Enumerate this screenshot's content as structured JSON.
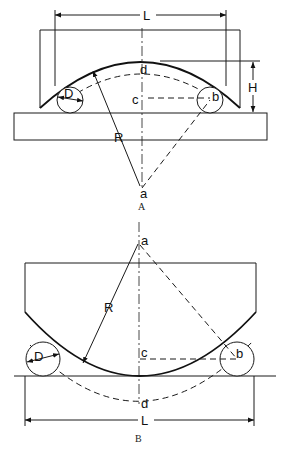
{
  "figure_a": {
    "caption": "A",
    "labels": {
      "L": "L",
      "H": "H",
      "D": "D",
      "R": "R",
      "a": "a",
      "b": "b",
      "c": "c",
      "d": "d"
    }
  },
  "figure_b": {
    "caption": "B",
    "labels": {
      "L": "L",
      "D": "D",
      "R": "R",
      "a": "a",
      "b": "b",
      "c": "c",
      "d": "d"
    }
  }
}
